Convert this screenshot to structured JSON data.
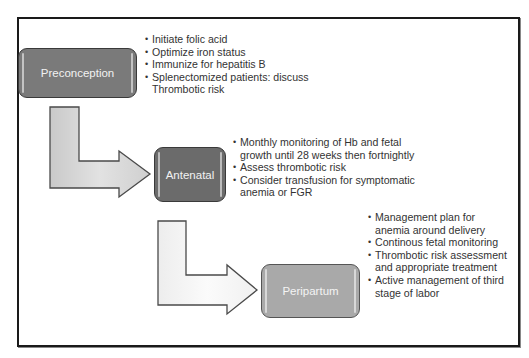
{
  "diagram": {
    "type": "flow",
    "stages": [
      {
        "label": "Preconception",
        "color": "#7a7a7a",
        "bullets": [
          "Initiate folic acid",
          "Optimize iron status",
          "Immunize for hepatitis B",
          "Splenectomized patients: discuss Thrombotic risk"
        ]
      },
      {
        "label": "Antenatal",
        "color": "#6b6b6b",
        "bullets": [
          "Monthly monitoring of Hb and fetal growth until 28 weeks then fortnightly",
          "Assess thrombotic risk",
          "Consider transfusion for symptomatic anemia or FGR"
        ]
      },
      {
        "label": "Peripartum",
        "color": "#a9a9a9",
        "bullets": [
          "Management plan for anemia around delivery",
          "Continous fetal monitoring",
          "Thrombotic risk assessment and appropriate treatment",
          "Active management of third stage of labor"
        ]
      }
    ],
    "connectors": [
      {
        "from": "Preconception",
        "to": "Antenatal",
        "shape": "L-arrow",
        "fill": "#d8d8d8"
      },
      {
        "from": "Antenatal",
        "to": "Peripartum",
        "shape": "L-arrow",
        "fill": "#f2f2f2"
      }
    ]
  }
}
